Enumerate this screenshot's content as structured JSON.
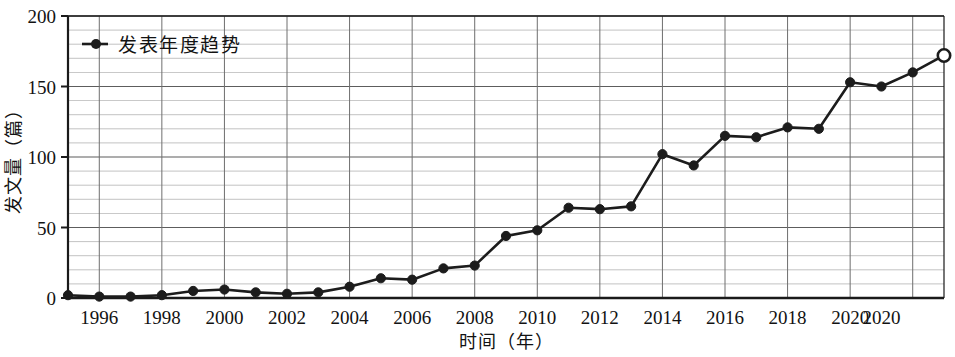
{
  "chart_data": {
    "type": "line",
    "title": "",
    "xlabel": "时间（年）",
    "ylabel": "发文量（篇）",
    "legend": [
      "发表年度趋势"
    ],
    "legend_position": "top-left-inside",
    "grid": true,
    "grid_major_step_y": 50,
    "grid_minor_step_y": 10,
    "grid_step_x": 2,
    "xlim": [
      1995,
      2021
    ],
    "ylim": [
      0,
      200
    ],
    "yticks": [
      0,
      50,
      100,
      150,
      200
    ],
    "ytick_labels": [
      "0",
      "50",
      "100",
      "150",
      "200"
    ],
    "xticks": [
      1996,
      1998,
      2000,
      2002,
      2004,
      2006,
      2008,
      2010,
      2012,
      2014,
      2016,
      2018,
      2020,
      2021
    ],
    "xtick_labels": [
      "1996",
      "1998",
      "2000",
      "2002",
      "2004",
      "2006",
      "2008",
      "2010",
      "2012",
      "2014",
      "2016",
      "2018",
      "2020",
      "2020"
    ],
    "x": [
      1995,
      1996,
      1997,
      1998,
      1999,
      2000,
      2001,
      2002,
      2003,
      2004,
      2005,
      2006,
      2007,
      2008,
      2009,
      2010,
      2011,
      2012,
      2013,
      2014,
      2015,
      2016,
      2017,
      2018,
      2019,
      2020,
      2021
    ],
    "values": [
      2,
      1,
      1,
      2,
      5,
      6,
      4,
      3,
      4,
      8,
      14,
      13,
      21,
      23,
      44,
      48,
      64,
      63,
      65,
      102,
      94,
      115,
      114,
      121,
      120,
      153,
      150
    ],
    "series": [
      {
        "name": "发表年度趋势",
        "marker": "filled-circle",
        "open_marker_index": 27,
        "x": [
          1995,
          1996,
          1997,
          1998,
          1999,
          2000,
          2001,
          2002,
          2003,
          2004,
          2005,
          2006,
          2007,
          2008,
          2009,
          2010,
          2011,
          2012,
          2013,
          2014,
          2015,
          2016,
          2017,
          2018,
          2019,
          2020,
          2021,
          2022
        ],
        "values": [
          2,
          1,
          1,
          2,
          5,
          6,
          4,
          3,
          4,
          8,
          14,
          13,
          21,
          23,
          44,
          48,
          64,
          63,
          65,
          102,
          94,
          115,
          114,
          121,
          120,
          153,
          150,
          160
        ]
      }
    ],
    "points": [
      {
        "x": 1995,
        "y": 2,
        "marker": "filled"
      },
      {
        "x": 1996,
        "y": 1,
        "marker": "filled"
      },
      {
        "x": 1997,
        "y": 1,
        "marker": "filled"
      },
      {
        "x": 1998,
        "y": 2,
        "marker": "filled"
      },
      {
        "x": 1999,
        "y": 5,
        "marker": "filled"
      },
      {
        "x": 2000,
        "y": 6,
        "marker": "filled"
      },
      {
        "x": 2001,
        "y": 4,
        "marker": "filled"
      },
      {
        "x": 2002,
        "y": 3,
        "marker": "filled"
      },
      {
        "x": 2003,
        "y": 4,
        "marker": "filled"
      },
      {
        "x": 2004,
        "y": 8,
        "marker": "filled"
      },
      {
        "x": 2005,
        "y": 14,
        "marker": "filled"
      },
      {
        "x": 2006,
        "y": 13,
        "marker": "filled"
      },
      {
        "x": 2007,
        "y": 21,
        "marker": "filled"
      },
      {
        "x": 2008,
        "y": 23,
        "marker": "filled"
      },
      {
        "x": 2009,
        "y": 44,
        "marker": "filled"
      },
      {
        "x": 2010,
        "y": 48,
        "marker": "filled"
      },
      {
        "x": 2011,
        "y": 64,
        "marker": "filled"
      },
      {
        "x": 2012,
        "y": 63,
        "marker": "filled"
      },
      {
        "x": 2013,
        "y": 65,
        "marker": "filled"
      },
      {
        "x": 2014,
        "y": 102,
        "marker": "filled"
      },
      {
        "x": 2015,
        "y": 94,
        "marker": "filled"
      },
      {
        "x": 2016,
        "y": 115,
        "marker": "filled"
      },
      {
        "x": 2017,
        "y": 114,
        "marker": "filled"
      },
      {
        "x": 2018,
        "y": 121,
        "marker": "filled"
      },
      {
        "x": 2019,
        "y": 120,
        "marker": "filled"
      },
      {
        "x": 2020,
        "y": 153,
        "marker": "filled"
      },
      {
        "x": 2021,
        "y": 150,
        "marker": "filled"
      },
      {
        "x": 2022,
        "y": 160,
        "marker": "filled"
      },
      {
        "x": 2023,
        "y": 172,
        "marker": "open"
      }
    ],
    "line_color": "#1c1c1c",
    "marker_color": "#1c1c1c",
    "grid_color": "#9a9a9a",
    "axis_color": "#1a1a1a",
    "background": "#ffffff"
  }
}
